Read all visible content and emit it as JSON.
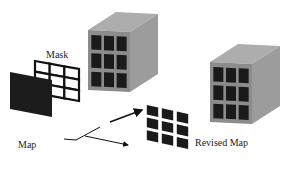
{
  "labels": {
    "mask": "Mask",
    "map": "Map",
    "revised_map": "Revised Map"
  },
  "colors": {
    "cube_front": "#8a8a8a",
    "cube_top": "#a9a9a9",
    "cube_side": "#9a9a9a",
    "cell_dark": "#1a1a1a",
    "map_fill": "#1c1c1c",
    "mask_cell": "#ffffff",
    "line": "#111111"
  },
  "grid": {
    "rows": 3,
    "cols": 3
  }
}
